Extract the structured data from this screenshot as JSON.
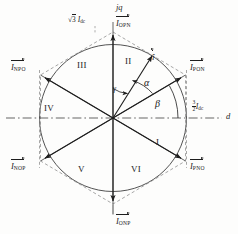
{
  "figure": {
    "axes": {
      "vertical_label": "jq",
      "horizontal_label": "d"
    },
    "vectors": [
      {
        "name": "I_OPN",
        "base": "I",
        "sub": "OPN",
        "angle_deg": 90,
        "position": "top"
      },
      {
        "name": "I_PON",
        "base": "I",
        "sub": "PON",
        "angle_deg": 30,
        "position": "upper-right"
      },
      {
        "name": "I_PNO",
        "base": "I",
        "sub": "PNO",
        "angle_deg": -30,
        "position": "lower-right"
      },
      {
        "name": "I_ONP",
        "base": "I",
        "sub": "ONP",
        "angle_deg": -90,
        "position": "bottom"
      },
      {
        "name": "I_NOP",
        "base": "I",
        "sub": "NOP",
        "angle_deg": -150,
        "position": "lower-left"
      },
      {
        "name": "I_NPO",
        "base": "I",
        "sub": "NPO",
        "angle_deg": 150,
        "position": "upper-left"
      }
    ],
    "reference_vector": {
      "base": "i",
      "caret": true,
      "angle_deg": 58
    },
    "sectors": [
      {
        "label": "I",
        "angle_center_deg": -30
      },
      {
        "label": "II",
        "angle_center_deg": 60
      },
      {
        "label": "III",
        "angle_center_deg": 120
      },
      {
        "label": "IV",
        "angle_center_deg": 180
      },
      {
        "label": "V",
        "angle_center_deg": 240
      },
      {
        "label": "VI",
        "angle_center_deg": 300
      }
    ],
    "angles": [
      {
        "symbol": "α",
        "name": "alpha",
        "from": "I_PON",
        "to": "reference-vector"
      },
      {
        "symbol": "β",
        "name": "beta",
        "from": "d-axis",
        "to": "I_PON"
      },
      {
        "symbol": "γ",
        "name": "gamma",
        "from": "reference-vector",
        "to": "jq-axis"
      }
    ],
    "magnitudes": [
      {
        "name": "hexagon-vertex-magnitude",
        "prefix": "√3",
        "symbol": "I",
        "sub": "dc",
        "position": "top-left"
      },
      {
        "name": "inscribed-circle-radius",
        "num": "3",
        "den": "2",
        "symbol": "I",
        "sub": "dc",
        "position": "right"
      }
    ],
    "colors": {
      "line": "#2a2a2a",
      "circle": "#3a3a3a",
      "dashed": "#6b6b6b",
      "background": "#fdfdfc"
    }
  }
}
